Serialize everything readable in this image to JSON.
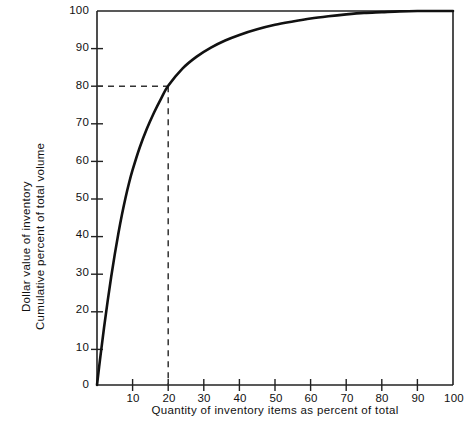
{
  "chart_data": {
    "type": "line",
    "title": "",
    "subtitle": "",
    "xlabel": "Quantity of inventory items as percent of total",
    "ylabel_lines": [
      "Dollar value of inventory",
      "Cumulative percent of total  volume"
    ],
    "xlim": [
      0,
      100
    ],
    "ylim": [
      0,
      100
    ],
    "grid": false,
    "legend": null,
    "xticks": [
      0,
      10,
      20,
      30,
      40,
      50,
      60,
      70,
      80,
      90,
      100
    ],
    "xticklabels": [
      "",
      "10",
      "20",
      "30",
      "40",
      "50",
      "60",
      "70",
      "80",
      "90",
      "100"
    ],
    "yticks": [
      0,
      10,
      20,
      30,
      40,
      50,
      60,
      70,
      80,
      90,
      100
    ],
    "yticklabels": [
      "0",
      "10",
      "20",
      "30",
      "40",
      "50",
      "60",
      "70",
      "80",
      "90",
      "100"
    ],
    "series": [
      {
        "name": "Cumulative dollar value curve",
        "x": [
          0,
          1,
          2,
          3,
          4,
          5,
          6,
          7,
          8,
          9,
          10,
          12,
          14,
          16,
          18,
          20,
          24,
          28,
          32,
          36,
          40,
          45,
          50,
          55,
          60,
          65,
          70,
          75,
          80,
          85,
          90,
          95,
          100
        ],
        "values": [
          0,
          8,
          15.5,
          22.5,
          29,
          35,
          40.5,
          45.5,
          50,
          54,
          57.5,
          63.5,
          68.5,
          72.8,
          76.6,
          80,
          84.6,
          87.8,
          90.2,
          92.1,
          93.6,
          95.1,
          96.3,
          97.2,
          98.0,
          98.6,
          99.1,
          99.5,
          99.7,
          99.9,
          100,
          100,
          100
        ]
      }
    ],
    "annotations": [
      {
        "name": "reference-point",
        "x": 20,
        "y": 80,
        "note": "dashed guide lines mark 20 percent of items accounting for 80 percent of value"
      }
    ],
    "reference_lines": [
      {
        "orientation": "horizontal",
        "value": 80,
        "style": "dashed",
        "from_x": 0,
        "to_x": 20
      },
      {
        "orientation": "vertical",
        "value": 20,
        "style": "dashed",
        "from_y": 0,
        "to_y": 80
      }
    ],
    "colors": {
      "curve": "#111111",
      "axis": "#222222",
      "dashed": "#333333",
      "background": "#ffffff"
    }
  }
}
